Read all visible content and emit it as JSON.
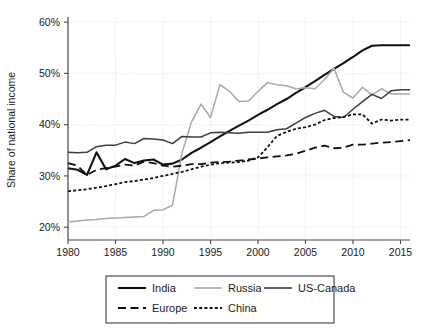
{
  "chart_data": {
    "type": "line",
    "title": "",
    "xlabel": "",
    "ylabel": "Share of national income",
    "xlim": [
      1980,
      2016
    ],
    "ylim": [
      17.5,
      61
    ],
    "grid": true,
    "legend_position": "bottom",
    "x_ticks": [
      1980,
      1985,
      1990,
      1995,
      2000,
      2005,
      2010,
      2015
    ],
    "x_tick_labels": [
      "1980",
      "1985",
      "1990",
      "1995",
      "2000",
      "2005",
      "2010",
      "2015"
    ],
    "y_ticks": [
      20,
      30,
      40,
      50,
      60
    ],
    "y_tick_labels": [
      "20%",
      "30%",
      "40%",
      "50%",
      "60%"
    ],
    "x": [
      1980,
      1981,
      1982,
      1983,
      1984,
      1985,
      1986,
      1987,
      1988,
      1989,
      1990,
      1991,
      1992,
      1993,
      1994,
      1995,
      1996,
      1997,
      1998,
      1999,
      2000,
      2001,
      2002,
      2003,
      2004,
      2005,
      2006,
      2007,
      2008,
      2009,
      2010,
      2011,
      2012,
      2013,
      2014,
      2015,
      2016
    ],
    "series": [
      {
        "name": "India",
        "style": "solid",
        "color": "#111111",
        "width": 2.1,
        "values": [
          31.5,
          31.2,
          30.2,
          34.6,
          31.3,
          32.0,
          33.3,
          32.5,
          33.0,
          33.2,
          32.2,
          32.4,
          33.2,
          34.5,
          35.5,
          36.6,
          37.7,
          38.8,
          39.8,
          40.8,
          41.9,
          42.9,
          44.0,
          45.0,
          46.2,
          47.3,
          48.5,
          49.7,
          50.9,
          52.0,
          53.2,
          54.5,
          55.4,
          55.5,
          55.5,
          55.5,
          55.5
        ]
      },
      {
        "name": "Russia",
        "style": "solid",
        "color": "#a9a9a9",
        "width": 1.5,
        "values": [
          21.0,
          21.2,
          21.4,
          21.5,
          21.7,
          21.8,
          21.9,
          22.0,
          22.1,
          23.3,
          23.4,
          24.3,
          34.5,
          40.5,
          44.0,
          41.4,
          47.8,
          46.5,
          44.5,
          44.6,
          46.5,
          48.2,
          47.8,
          47.6,
          47.0,
          47.2,
          47.0,
          48.8,
          51.0,
          46.3,
          45.2,
          47.3,
          45.8,
          47.0,
          46.0,
          46.0,
          46.0
        ]
      },
      {
        "name": "US-Canada",
        "style": "solid",
        "color": "#3d3d3d",
        "width": 1.5,
        "values": [
          34.6,
          34.5,
          34.6,
          35.7,
          36.0,
          36.0,
          36.6,
          36.3,
          37.3,
          37.2,
          37.0,
          36.3,
          37.7,
          37.6,
          37.6,
          38.4,
          38.5,
          38.4,
          38.3,
          38.5,
          38.5,
          38.5,
          39.0,
          39.2,
          40.3,
          41.4,
          42.2,
          42.8,
          41.6,
          41.4,
          43.0,
          44.5,
          45.9,
          45.1,
          46.6,
          46.8,
          46.8
        ]
      },
      {
        "name": "Europe",
        "style": "dashed",
        "color": "#111111",
        "width": 1.8,
        "values": [
          32.5,
          32.0,
          30.2,
          31.2,
          31.5,
          31.8,
          32.2,
          32.0,
          32.8,
          32.5,
          32.0,
          31.8,
          32.0,
          32.3,
          32.3,
          32.6,
          32.7,
          32.8,
          33.0,
          33.2,
          33.4,
          33.6,
          33.8,
          34.0,
          34.3,
          34.9,
          35.5,
          35.9,
          35.4,
          35.5,
          36.1,
          36.1,
          36.3,
          36.5,
          36.6,
          36.8,
          37.0
        ]
      },
      {
        "name": "China",
        "style": "dotted",
        "color": "#111111",
        "width": 1.8,
        "values": [
          27.0,
          27.2,
          27.4,
          27.7,
          28.0,
          28.4,
          28.8,
          29.0,
          29.3,
          29.6,
          30.0,
          30.4,
          30.8,
          31.3,
          31.8,
          32.2,
          32.5,
          32.6,
          32.7,
          33.0,
          33.6,
          35.6,
          37.8,
          38.6,
          39.2,
          39.5,
          40.0,
          40.9,
          41.3,
          41.5,
          42.0,
          42.0,
          40.2,
          41.0,
          40.8,
          41.0,
          41.0
        ]
      }
    ]
  },
  "legend": {
    "items": [
      {
        "label": "India",
        "key": "india"
      },
      {
        "label": "Russia",
        "key": "russia"
      },
      {
        "label": "US-Canada",
        "key": "us-canada"
      },
      {
        "label": "Europe",
        "key": "europe"
      },
      {
        "label": "China",
        "key": "china"
      }
    ]
  },
  "colors": {
    "india": "#111111",
    "russia": "#a9a9a9",
    "us_canada": "#3d3d3d",
    "europe": "#111111",
    "china": "#111111",
    "axis": "#4a4a4a",
    "grid": "#d8d8d8",
    "background": "#ffffff"
  }
}
